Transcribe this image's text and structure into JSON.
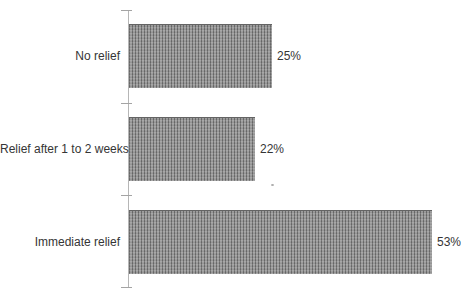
{
  "chart_data": {
    "type": "bar",
    "orientation": "horizontal",
    "title": "",
    "xlabel": "",
    "ylabel": "",
    "categories": [
      "No relief",
      "Relief after 1 to 2 weeks",
      "Immediate relief"
    ],
    "values": [
      25,
      22,
      53
    ],
    "value_labels": [
      "25%",
      "22%",
      "53%"
    ],
    "xlim": [
      0,
      58
    ],
    "grid": false,
    "legend": null,
    "bar_style": "gray-vertical-hatch",
    "colors": {
      "bar_stripe_dark": "#6c6c6c",
      "bar_stripe_light": "#9e9e9e",
      "axis": "#b6b6b6",
      "text": "#353535",
      "background": "#ffffff"
    }
  }
}
